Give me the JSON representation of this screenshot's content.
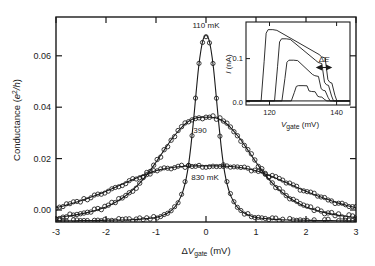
{
  "figure": {
    "background": "#ffffff",
    "ink": "#1a1a1a"
  },
  "main_axes": {
    "ylabel_main": "Conductance (",
    "ylabel_unit_num": "e",
    "ylabel_unit_sup": "2",
    "ylabel_unit_den": "/h",
    "ylabel_close": ")",
    "xlabel_delta": "Δ",
    "xlabel_v": "V",
    "xlabel_sub": "gate",
    "xlabel_unit": " (mV)",
    "xticks": [
      "-3",
      "-2",
      "-1",
      "0",
      "1",
      "2",
      "3"
    ],
    "yticks": [
      "0.00",
      "0.02",
      "0.04",
      "0.06"
    ],
    "xlim": [
      -3,
      3
    ],
    "ylim": [
      0,
      0.072
    ]
  },
  "curve_labels": [
    {
      "name": "label-110mK",
      "text": "110 mK"
    },
    {
      "name": "label-390mK",
      "text": "390"
    },
    {
      "name": "label-830mK",
      "text": "830 mK"
    }
  ],
  "inset": {
    "ylabel_i": "I",
    "ylabel_unit": " (nA)",
    "xlabel_v": "V",
    "xlabel_sub": "gate",
    "xlabel_unit": " (mV)",
    "xticks": [
      "120",
      "140"
    ],
    "yticks": [
      "0.0",
      "0.1"
    ],
    "annotation_delta": "Δ",
    "annotation_e": "E",
    "xlim": [
      113,
      144
    ],
    "ylim": [
      -0.008,
      0.155
    ]
  },
  "chart_data": {
    "type": "line",
    "title": "",
    "xlabel": "ΔV_gate (mV)",
    "ylabel": "Conductance (e^2/h)",
    "xlim": [
      -3,
      3
    ],
    "ylim": [
      0,
      0.072
    ],
    "grid": false,
    "legend": "inline-annotations",
    "marker": "open-circle",
    "series": [
      {
        "name": "110 mK",
        "label": "110 mK",
        "peak": 0.0655,
        "fwhm_mV": 0.55,
        "x": [
          -3.0,
          -2.75,
          -2.5,
          -2.25,
          -2.0,
          -1.75,
          -1.5,
          -1.25,
          -1.0,
          -0.9,
          -0.8,
          -0.7,
          -0.6,
          -0.5,
          -0.45,
          -0.4,
          -0.35,
          -0.3,
          -0.25,
          -0.2,
          -0.15,
          -0.1,
          -0.05,
          0.0,
          0.05,
          0.1,
          0.15,
          0.2,
          0.25,
          0.3,
          0.35,
          0.4,
          0.45,
          0.5,
          0.6,
          0.7,
          0.8,
          0.9,
          1.0,
          1.25,
          1.5,
          1.75,
          2.0,
          2.25,
          2.5,
          2.75,
          3.0
        ],
        "y": [
          0.0004,
          0.0004,
          0.0005,
          0.0005,
          0.0006,
          0.0007,
          0.0008,
          0.0011,
          0.0016,
          0.0021,
          0.0028,
          0.004,
          0.0058,
          0.009,
          0.0115,
          0.015,
          0.02,
          0.027,
          0.0355,
          0.045,
          0.054,
          0.0605,
          0.0645,
          0.0655,
          0.0645,
          0.0605,
          0.054,
          0.045,
          0.0355,
          0.027,
          0.02,
          0.015,
          0.0115,
          0.009,
          0.0058,
          0.004,
          0.0028,
          0.0021,
          0.0016,
          0.0011,
          0.0008,
          0.0007,
          0.0006,
          0.0005,
          0.0005,
          0.0004,
          0.0004
        ]
      },
      {
        "name": "390 mK",
        "label": "390",
        "peak": 0.0368,
        "fwhm_mV": 1.45,
        "x": [
          -3.0,
          -2.8,
          -2.6,
          -2.4,
          -2.2,
          -2.0,
          -1.8,
          -1.6,
          -1.4,
          -1.2,
          -1.0,
          -0.9,
          -0.8,
          -0.7,
          -0.6,
          -0.5,
          -0.4,
          -0.3,
          -0.2,
          -0.1,
          0.0,
          0.1,
          0.2,
          0.3,
          0.4,
          0.5,
          0.6,
          0.7,
          0.8,
          0.9,
          1.0,
          1.2,
          1.4,
          1.6,
          1.8,
          2.0,
          2.2,
          2.4,
          2.6,
          2.8,
          3.0
        ],
        "y": [
          0.0016,
          0.002,
          0.0025,
          0.0032,
          0.0041,
          0.0053,
          0.007,
          0.0093,
          0.0123,
          0.0162,
          0.021,
          0.0236,
          0.0262,
          0.0288,
          0.031,
          0.033,
          0.0347,
          0.0358,
          0.0365,
          0.0368,
          0.0368,
          0.0368,
          0.0365,
          0.0358,
          0.0347,
          0.033,
          0.031,
          0.0288,
          0.0262,
          0.0236,
          0.021,
          0.0162,
          0.0123,
          0.0093,
          0.007,
          0.0053,
          0.0041,
          0.0032,
          0.0025,
          0.002,
          0.0016
        ]
      },
      {
        "name": "830 mK",
        "label": "830 mK",
        "peak": 0.0196,
        "fwhm_mV": 3.1,
        "x": [
          -3.0,
          -2.8,
          -2.6,
          -2.4,
          -2.2,
          -2.0,
          -1.8,
          -1.6,
          -1.4,
          -1.2,
          -1.0,
          -0.8,
          -0.6,
          -0.4,
          -0.2,
          0.0,
          0.2,
          0.4,
          0.6,
          0.8,
          1.0,
          1.2,
          1.4,
          1.6,
          1.8,
          2.0,
          2.2,
          2.4,
          2.6,
          2.8,
          3.0
        ],
        "y": [
          0.005,
          0.0059,
          0.0069,
          0.0081,
          0.0094,
          0.0108,
          0.0123,
          0.0139,
          0.0154,
          0.0168,
          0.018,
          0.0188,
          0.0193,
          0.0196,
          0.0197,
          0.0197,
          0.0197,
          0.0196,
          0.0193,
          0.0188,
          0.018,
          0.0168,
          0.0154,
          0.0139,
          0.0123,
          0.0108,
          0.0094,
          0.0081,
          0.0069,
          0.0059,
          0.005
        ]
      }
    ],
    "inset_chart": {
      "type": "line",
      "xlabel": "V_gate (mV)",
      "ylabel": "I (nA)",
      "xlim": [
        113,
        144
      ],
      "ylim": [
        -0.008,
        0.155
      ],
      "xticks": [
        120,
        140
      ],
      "yticks": [
        0.0,
        0.1
      ],
      "annotation": "ΔE",
      "series": [
        {
          "name": "trace-1",
          "plateau": 0.14,
          "onset": 118.0,
          "offset": 139.2
        },
        {
          "name": "trace-2",
          "plateau": 0.122,
          "onset": 122.0,
          "offset": 138.2
        },
        {
          "name": "trace-3",
          "plateau": 0.08,
          "onset": 124.2,
          "offset": 137.2
        },
        {
          "name": "trace-4",
          "plateau": 0.03,
          "onset": 127.0,
          "offset": 136.2
        }
      ]
    }
  }
}
